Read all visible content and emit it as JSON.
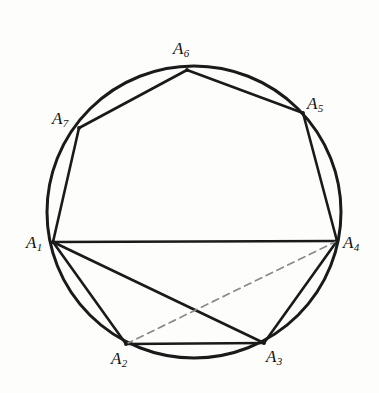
{
  "figure": {
    "type": "geometry-diagram",
    "background_color": "#fdfdfc",
    "stroke_color": "#1a1a1a",
    "dashed_stroke_color": "#8a8a8a"
  },
  "circle": {
    "name": "circumscribed-circle",
    "center_x": 194,
    "center_y": 212,
    "radius": 147,
    "stroke_width": 3.0
  },
  "vertices": [
    {
      "id": "A1",
      "label": "A",
      "subscript": "1",
      "x": 53,
      "y": 242,
      "label_x": 26,
      "label_y": 234,
      "label_anchor": "left"
    },
    {
      "id": "A2",
      "label": "A",
      "subscript": "2",
      "x": 126,
      "y": 344,
      "label_x": 111,
      "label_y": 350,
      "label_anchor": "below"
    },
    {
      "id": "A3",
      "label": "A",
      "subscript": "3",
      "x": 264,
      "y": 343,
      "label_x": 266,
      "label_y": 348,
      "label_anchor": "below-right"
    },
    {
      "id": "A4",
      "label": "A",
      "subscript": "4",
      "x": 337,
      "y": 241,
      "label_x": 343,
      "label_y": 234,
      "label_anchor": "right"
    },
    {
      "id": "A5",
      "label": "A",
      "subscript": "5",
      "x": 303,
      "y": 113,
      "label_x": 307,
      "label_y": 95,
      "label_anchor": "above-right"
    },
    {
      "id": "A6",
      "label": "A",
      "subscript": "6",
      "x": 187,
      "y": 70,
      "label_x": 173,
      "label_y": 40,
      "label_anchor": "above"
    },
    {
      "id": "A7",
      "label": "A",
      "subscript": "7",
      "x": 79,
      "y": 128,
      "label_x": 52,
      "label_y": 110,
      "label_anchor": "above-left"
    }
  ],
  "edges": [
    {
      "name": "side-A1-A7",
      "from": "A1",
      "to": "A7",
      "style": "solid",
      "width": 2.6
    },
    {
      "name": "side-A7-A6",
      "from": "A7",
      "to": "A6",
      "style": "solid",
      "width": 2.6
    },
    {
      "name": "side-A6-A5",
      "from": "A6",
      "to": "A5",
      "style": "solid",
      "width": 2.6
    },
    {
      "name": "side-A5-A4",
      "from": "A5",
      "to": "A4",
      "style": "solid",
      "width": 2.6
    },
    {
      "name": "chord-A1-A4",
      "from": "A1",
      "to": "A4",
      "style": "solid",
      "width": 2.6
    },
    {
      "name": "side-A1-A2",
      "from": "A1",
      "to": "A2",
      "style": "solid",
      "width": 2.6
    },
    {
      "name": "side-A2-A3",
      "from": "A2",
      "to": "A3",
      "style": "solid",
      "width": 2.6
    },
    {
      "name": "side-A3-A4",
      "from": "A3",
      "to": "A4",
      "style": "solid",
      "width": 2.6
    },
    {
      "name": "diagonal-A1-A3",
      "from": "A1",
      "to": "A3",
      "style": "solid",
      "width": 2.6
    },
    {
      "name": "diagonal-A2-A4",
      "from": "A2",
      "to": "A4",
      "style": "dashed",
      "width": 1.7,
      "dash_pattern": "7 5"
    }
  ]
}
